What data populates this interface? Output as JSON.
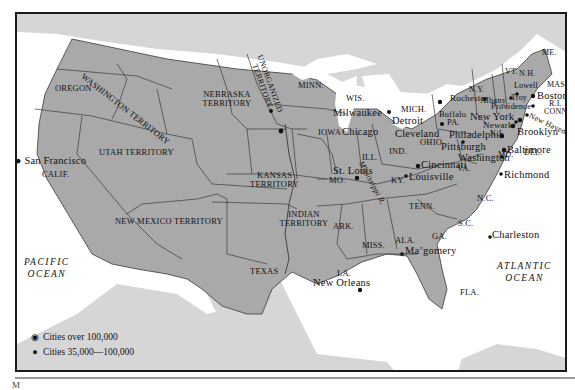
{
  "map": {
    "colors": {
      "us": "#a9a9a9",
      "foreign": "#d6d6d6",
      "water": "#ffffff",
      "border": "#3a3a3a",
      "frame": "#1a1a1a"
    },
    "regions": [
      {
        "id": "washington-territory",
        "label": "WASHINGTON TERRITORY"
      },
      {
        "id": "oregon",
        "label": "OREGON"
      },
      {
        "id": "nebraska-territory",
        "label": "NEBRASKA TERRITORY"
      },
      {
        "id": "unorganized-territory",
        "label": "UNORGANIZED TERRITORY"
      },
      {
        "id": "minn",
        "label": "MINN."
      },
      {
        "id": "wis",
        "label": "WIS."
      },
      {
        "id": "mich",
        "label": "MICH."
      },
      {
        "id": "iowa",
        "label": "IOWA"
      },
      {
        "id": "ill",
        "label": "ILL."
      },
      {
        "id": "ind",
        "label": "IND."
      },
      {
        "id": "ohio",
        "label": "OHIO"
      },
      {
        "id": "pa",
        "label": "PA."
      },
      {
        "id": "ny",
        "label": "N.Y."
      },
      {
        "id": "vt",
        "label": "VT."
      },
      {
        "id": "nh",
        "label": "N.H."
      },
      {
        "id": "me",
        "label": "ME."
      },
      {
        "id": "mass",
        "label": "MASS."
      },
      {
        "id": "ri",
        "label": "R.I."
      },
      {
        "id": "conn",
        "label": "CONN."
      },
      {
        "id": "nj",
        "label": "N.J."
      },
      {
        "id": "del",
        "label": "DEL."
      },
      {
        "id": "md",
        "label": "MD."
      },
      {
        "id": "va",
        "label": "VA."
      },
      {
        "id": "nc",
        "label": "N.C."
      },
      {
        "id": "sc",
        "label": "S.C."
      },
      {
        "id": "ga",
        "label": "GA."
      },
      {
        "id": "fla",
        "label": "FLA."
      },
      {
        "id": "ala",
        "label": "ALA."
      },
      {
        "id": "miss",
        "label": "MISS."
      },
      {
        "id": "tenn",
        "label": "TENN."
      },
      {
        "id": "ky",
        "label": "KY."
      },
      {
        "id": "mo",
        "label": "MO."
      },
      {
        "id": "ark",
        "label": "ARK."
      },
      {
        "id": "la",
        "label": "LA."
      },
      {
        "id": "texas",
        "label": "TEXAS"
      },
      {
        "id": "indian-territory",
        "label": "INDIAN TERRITORY"
      },
      {
        "id": "kansas-territory",
        "label": "KANSAS TERRITORY"
      },
      {
        "id": "new-mexico-territory",
        "label": "NEW MEXICO TERRITORY"
      },
      {
        "id": "utah-territory",
        "label": "UTAH TERRITORY"
      },
      {
        "id": "calif",
        "label": "CALIF."
      }
    ],
    "cities": [
      {
        "name": "San Francisco",
        "size": "large"
      },
      {
        "name": "Milwaukee",
        "size": "small"
      },
      {
        "name": "Chicago",
        "size": "large"
      },
      {
        "name": "Detroit",
        "size": "small"
      },
      {
        "name": "Cleveland",
        "size": "small"
      },
      {
        "name": "Rochester",
        "size": "small"
      },
      {
        "name": "Buffalo",
        "size": "large"
      },
      {
        "name": "Albany",
        "size": "small"
      },
      {
        "name": "Lowell",
        "size": "small"
      },
      {
        "name": "Troy",
        "size": "small"
      },
      {
        "name": "Boston",
        "size": "large"
      },
      {
        "name": "Providence",
        "size": "small"
      },
      {
        "name": "New York",
        "size": "large"
      },
      {
        "name": "New Haven",
        "size": "small"
      },
      {
        "name": "Newark",
        "size": "small"
      },
      {
        "name": "Brooklyn",
        "size": "large"
      },
      {
        "name": "Philadelphia",
        "size": "large"
      },
      {
        "name": "Pittsburgh",
        "size": "small"
      },
      {
        "name": "Baltimore",
        "size": "large"
      },
      {
        "name": "Washington",
        "size": "small"
      },
      {
        "name": "Richmond",
        "size": "small"
      },
      {
        "name": "Cincinnati",
        "size": "large"
      },
      {
        "name": "Louisville",
        "size": "small"
      },
      {
        "name": "St. Louis",
        "size": "large"
      },
      {
        "name": "Charleston",
        "size": "small"
      },
      {
        "name": "Montgomery",
        "size": "small",
        "display": "Mа’gomery"
      },
      {
        "name": "New Orleans",
        "size": "large"
      }
    ],
    "rivers": [
      {
        "label": "Mississippi R."
      }
    ],
    "oceans": [
      {
        "label": "PACIFIC OCEAN",
        "line1": "PACIFIC",
        "line2": "OCEAN"
      },
      {
        "label": "ATLANTIC OCEAN",
        "line1": "ATLANTIC",
        "line2": "OCEAN"
      }
    ],
    "legend": [
      {
        "symbol": "circled-dot",
        "label": "Cities over 100,000"
      },
      {
        "symbol": "dot",
        "label": "Cities 35,000—100,000"
      }
    ],
    "footer_glyph": "M"
  }
}
